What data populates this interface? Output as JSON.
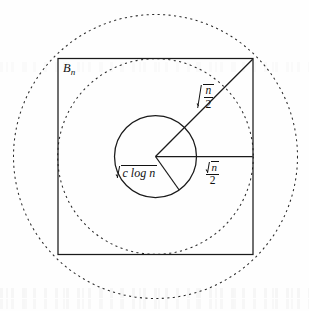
{
  "figure": {
    "kind": "geometric-diagram",
    "background_color": "#fefefe",
    "stroke_color": "#1a1a1a",
    "labels": {
      "box": {
        "base": "B",
        "subscript": "n"
      },
      "diagonal_radius": {
        "expression": "sqrt(n/2)",
        "numerator": "n",
        "denominator": "2",
        "style": "radical-over-fraction"
      },
      "horizontal_radius": {
        "expression": "sqrt(n)/2",
        "radicand": "n",
        "denominator": "2",
        "style": "fraction-with-radical-numerator"
      },
      "inner_circle_radius": {
        "expression": "sqrt(c log n)",
        "radicand": "c log n",
        "coefficient": "c",
        "function": "log",
        "argument": "n",
        "style": "inline-radical"
      }
    },
    "shapes": [
      {
        "name": "square-bn",
        "type": "square",
        "stroke": "solid",
        "center": [
          155.5,
          156.5
        ],
        "half_side": 97.5
      },
      {
        "name": "inscribed-dashed-circle",
        "type": "circle",
        "stroke": "dashed",
        "center": [
          155.5,
          156.5
        ],
        "radius": 97.5,
        "note": "tangent to square sides, radius sqrt(n)/2"
      },
      {
        "name": "circumscribed-dashed-circle",
        "type": "circle",
        "stroke": "dashed",
        "center": [
          155.5,
          156.5
        ],
        "radius": 142,
        "note": "through square corners, radius sqrt(n/2)"
      },
      {
        "name": "inner-solid-circle",
        "type": "circle",
        "stroke": "solid",
        "center": [
          155.5,
          156.5
        ],
        "radius": 41,
        "note": "radius sqrt(c log n)"
      },
      {
        "name": "diagonal-radius-line",
        "type": "line",
        "stroke": "solid",
        "from": [
          155.5,
          156.5
        ],
        "to": [
          253,
          58
        ],
        "note": "center to top-right corner of square"
      },
      {
        "name": "horizontal-radius-line",
        "type": "line",
        "stroke": "solid",
        "from": [
          155.5,
          156.5
        ],
        "to": [
          253,
          156.5
        ],
        "note": "center to right edge midpoint"
      },
      {
        "name": "wedge-lower-radius",
        "type": "line",
        "stroke": "solid",
        "from": [
          155.5,
          156.5
        ],
        "to": [
          179,
          190
        ],
        "note": "second wedge edge inside inner circle"
      }
    ]
  }
}
